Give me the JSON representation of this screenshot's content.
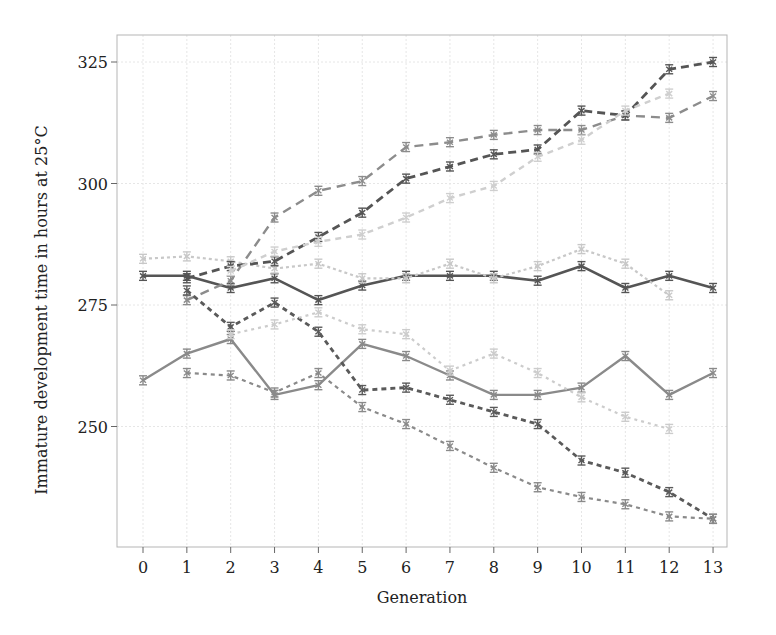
{
  "chart_data": {
    "type": "line",
    "title": "",
    "xlabel": "Generation",
    "ylabel": "Immature development time in hours at 25°C",
    "x": [
      0,
      1,
      2,
      3,
      4,
      5,
      6,
      7,
      8,
      9,
      10,
      11,
      12,
      13
    ],
    "x_tick_labels": [
      "0",
      "1",
      "2",
      "3",
      "4",
      "5",
      "6",
      "7",
      "8",
      "9",
      "10",
      "11",
      "12",
      "13"
    ],
    "y_ticks": [
      250,
      275,
      300,
      325
    ],
    "ylim": [
      220,
      330
    ],
    "xlim": [
      -0.6,
      13.6
    ],
    "grid": true,
    "legend": "none",
    "error_bars": true,
    "series": [
      {
        "name": "Control line A (solid dark)",
        "color": "#555555",
        "dash": "",
        "width": 2.6,
        "values": [
          281,
          281,
          278.5,
          280.5,
          276,
          279,
          281,
          281,
          281,
          280,
          283,
          278.5,
          281,
          278.5
        ]
      },
      {
        "name": "Control line B (solid medium)",
        "color": "#8a8a8a",
        "dash": "",
        "width": 2.4,
        "values": [
          259.5,
          265,
          268,
          256.5,
          258.5,
          267,
          264.5,
          260.5,
          256.5,
          256.5,
          258,
          264.5,
          256.5,
          261
        ]
      },
      {
        "name": "Control line C (light dotted)",
        "color": "#c8c8c8",
        "dash": "3,3",
        "width": 2.2,
        "values": [
          284.5,
          285,
          284,
          282.5,
          283.5,
          280.5,
          280.5,
          283.5,
          280.5,
          283,
          286.5,
          283.5,
          277,
          null
        ]
      },
      {
        "name": "Slow line A (medium dashed)",
        "color": "#8c8c8c",
        "dash": "9,6",
        "width": 2.4,
        "values": [
          null,
          276,
          280,
          293,
          298.5,
          300.5,
          307.5,
          308.5,
          310,
          311,
          311,
          314,
          313.5,
          318
        ]
      },
      {
        "name": "Slow line B (dark dashed)",
        "color": "#555555",
        "dash": "8,5",
        "width": 2.8,
        "values": [
          null,
          280.5,
          283,
          284,
          289,
          294,
          301,
          303.5,
          306,
          307,
          315,
          314,
          323.5,
          325
        ]
      },
      {
        "name": "Slow line C (light dashed)",
        "color": "#cfcfcf",
        "dash": "6,5",
        "width": 2.4,
        "values": [
          null,
          null,
          282,
          286,
          288,
          289.5,
          293,
          297,
          299.5,
          305.5,
          309,
          315,
          318.5,
          null
        ]
      },
      {
        "name": "Fast line A (dark short-dashed)",
        "color": "#5a5a5a",
        "dash": "5,4",
        "width": 2.8,
        "values": [
          null,
          278,
          270.5,
          275.5,
          269.5,
          257.5,
          258,
          255.5,
          253,
          250.5,
          243,
          240.5,
          236.5,
          231
        ]
      },
      {
        "name": "Fast line B (medium dotted)",
        "color": "#8a8a8a",
        "dash": "4,4",
        "width": 2.2,
        "values": [
          null,
          261,
          260.5,
          257,
          261,
          254,
          250.5,
          246,
          241.5,
          237.5,
          235.5,
          234,
          231.5,
          231
        ]
      },
      {
        "name": "Fast line C (light dotted)",
        "color": "#cccccc",
        "dash": "3,4",
        "width": 2.2,
        "values": [
          null,
          null,
          269,
          271,
          273.5,
          270,
          269,
          261.5,
          265,
          261,
          256,
          252,
          249.5,
          null
        ]
      }
    ]
  },
  "layout": {
    "plot_left": 117,
    "plot_right": 727,
    "plot_top": 35,
    "plot_bottom": 547,
    "x0_px": 143,
    "x_step_px": 43.85,
    "y_ref_value": 325,
    "y_ref_px": 62,
    "px_per_unit": 4.86
  }
}
